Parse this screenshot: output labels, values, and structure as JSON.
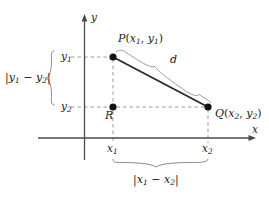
{
  "figure": {
    "background_color": "#ffffff",
    "axes": {
      "x_label": "x",
      "y_label": "y",
      "axis_color": "#4a4a4a"
    },
    "points": [
      {
        "id": "P",
        "label": "P(x₁, y₁)",
        "label_parts": {
          "name": "P",
          "open": "(",
          "x": "x",
          "xsub": "1",
          "comma": ", ",
          "y": "y",
          "ysub": "1",
          "close": ")"
        },
        "px": 113,
        "py": 57,
        "marker_color": "#111111"
      },
      {
        "id": "Q",
        "label": "Q(x₂, y₂)",
        "label_parts": {
          "name": "Q",
          "open": "(",
          "x": "x",
          "xsub": "2",
          "comma": ", ",
          "y": "y",
          "ysub": "2",
          "close": ")"
        },
        "px": 208,
        "py": 107,
        "marker_color": "#111111"
      },
      {
        "id": "R",
        "label": "R",
        "px": 113,
        "py": 107,
        "marker_color": "#111111"
      }
    ],
    "segments": [
      {
        "id": "PQ",
        "label": "d",
        "from": "P",
        "to": "Q",
        "style": "solid",
        "color": "#2b2b2b"
      }
    ],
    "tick_labels": {
      "x1": {
        "text": "x",
        "sub": "1"
      },
      "x2": {
        "text": "x",
        "sub": "2"
      },
      "y1": {
        "text": "y",
        "sub": "1"
      },
      "y2": {
        "text": "y",
        "sub": "2"
      }
    },
    "braces": [
      {
        "id": "vertical-brace",
        "orientation": "left",
        "label": "|y₁ − y₂|",
        "label_parts": {
          "bar1": "|",
          "a": "y",
          "asub": "1",
          "minus": " − ",
          "b": "y",
          "bsub": "2",
          "bar2": "|"
        },
        "color": "#8c8c8c"
      },
      {
        "id": "horizontal-brace",
        "orientation": "down",
        "label": "|x₁ − x₂|",
        "label_parts": {
          "bar1": "|",
          "a": "x",
          "asub": "1",
          "minus": " − ",
          "b": "x",
          "bsub": "2",
          "bar2": "|"
        },
        "color": "#8c8c8c"
      },
      {
        "id": "distance-brace",
        "orientation": "diagonal",
        "label": "d",
        "color": "#8c8c8c"
      }
    ],
    "dashed_lines": {
      "color": "#9b9b9b",
      "description": "guide lines from axes to P, R and Q"
    }
  }
}
